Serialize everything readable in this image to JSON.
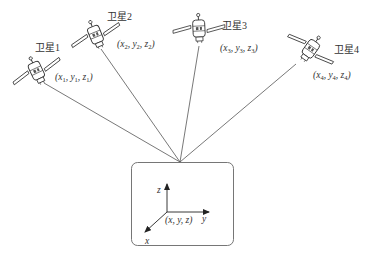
{
  "diagram": {
    "type": "gps-positioning",
    "satellites": [
      {
        "name": "卫星1",
        "coord_vars": [
          "x",
          "y",
          "z"
        ],
        "index": "1"
      },
      {
        "name": "卫星2",
        "coord_vars": [
          "x",
          "y",
          "z"
        ],
        "index": "2"
      },
      {
        "name": "卫星3",
        "coord_vars": [
          "x",
          "y",
          "z"
        ],
        "index": "3"
      },
      {
        "name": "卫星4",
        "coord_vars": [
          "x",
          "y",
          "z"
        ],
        "index": "4"
      }
    ],
    "receiver": {
      "coord_label": "(x, y, z)",
      "axes": {
        "x": "x",
        "y": "y",
        "z": "z"
      }
    },
    "colors": {
      "line": "#555555",
      "text": "#333333",
      "box": "#666666"
    }
  }
}
